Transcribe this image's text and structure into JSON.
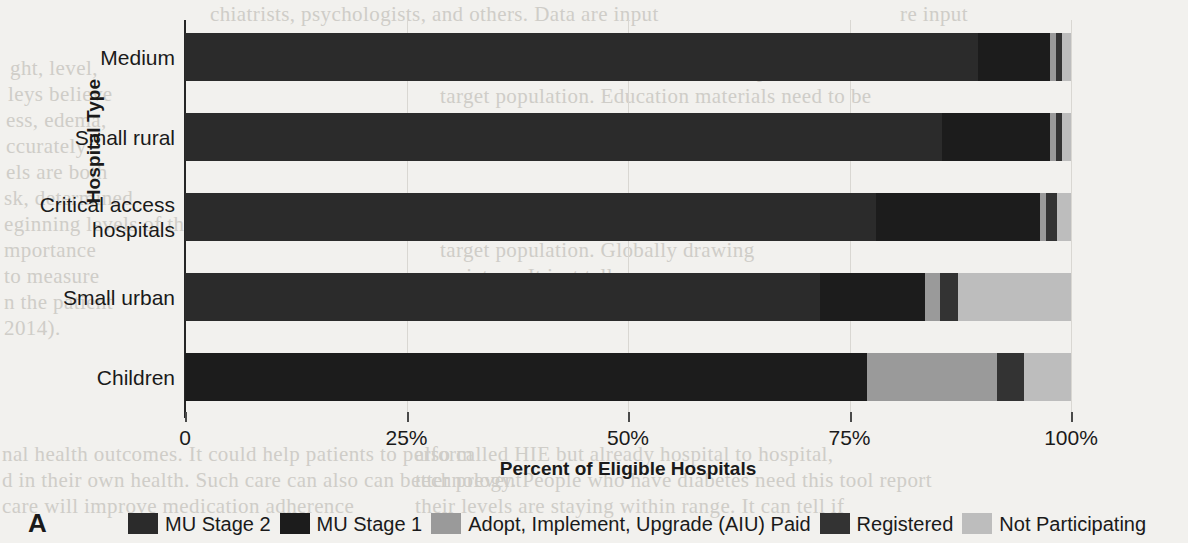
{
  "panel": {
    "letter": "A"
  },
  "axes": {
    "y_title": "Hospital Type",
    "x_title": "Percent of Eligible Hospitals",
    "x_ticks": [
      "0",
      "25%",
      "50%",
      "75%",
      "100%"
    ]
  },
  "legend": {
    "items": [
      {
        "label": "MU Stage 2",
        "color": "#2b2b2b"
      },
      {
        "label": "MU Stage 1",
        "color": "#1c1c1c"
      },
      {
        "label": "Adopt, Implement, Upgrade (AIU) Paid",
        "color": "#9a9a9a"
      },
      {
        "label": "Registered",
        "color": "#333333"
      },
      {
        "label": "Not Participating",
        "color": "#bdbdbd"
      }
    ]
  },
  "chart_data": {
    "type": "bar",
    "orientation": "horizontal",
    "stacked": true,
    "stack_total": 100,
    "title": "",
    "xlabel": "Percent of Eligible Hospitals",
    "ylabel": "Hospital Type",
    "xlim": [
      0,
      100
    ],
    "xticks": [
      0,
      25,
      50,
      75,
      100
    ],
    "xticklabels": [
      "0",
      "25%",
      "50%",
      "75%",
      "100%"
    ],
    "grid": true,
    "legend_position": "bottom",
    "categories": [
      "Medium",
      "Small rural",
      "Critical access\nhospitals",
      "Small urban",
      "Children"
    ],
    "series": [
      {
        "name": "MU Stage 2",
        "color": "#2b2b2b",
        "values": [
          89.5,
          85.4,
          78.0,
          71.7,
          0.0
        ]
      },
      {
        "name": "MU Stage 1",
        "color": "#1c1c1c",
        "values": [
          8.1,
          12.2,
          18.5,
          11.8,
          77.0
        ]
      },
      {
        "name": "Adopt, Implement, Upgrade (AIU) Paid",
        "color": "#9a9a9a",
        "values": [
          0.7,
          0.7,
          0.7,
          1.7,
          14.7
        ]
      },
      {
        "name": "Registered",
        "color": "#333333",
        "values": [
          0.7,
          0.7,
          1.2,
          2.0,
          3.0
        ]
      },
      {
        "name": "Not Participating",
        "color": "#bdbdbd",
        "values": [
          1.0,
          1.0,
          1.6,
          12.8,
          5.3
        ]
      }
    ]
  },
  "background_text": {
    "lines": [
      {
        "text": "chiatrists, psychologists, and others. Data are input",
        "x": 210,
        "y": 2
      },
      {
        "text": "e disease, chronic obstructive pulmonary disease.",
        "x": 200,
        "y": 30
      },
      {
        "text": "ght, level,",
        "x": 10,
        "y": 56
      },
      {
        "text": "leys believe",
        "x": 8,
        "y": 82
      },
      {
        "text": "ess, edema,",
        "x": 6,
        "y": 108
      },
      {
        "text": "ccurately",
        "x": 6,
        "y": 134
      },
      {
        "text": "els are both",
        "x": 6,
        "y": 160
      },
      {
        "text": "sk, determined",
        "x": 4,
        "y": 186
      },
      {
        "text": "eginning levels of their vitals will be able to comprehend",
        "x": 4,
        "y": 212
      },
      {
        "text": "mportance",
        "x": 4,
        "y": 238
      },
      {
        "text": "to measure",
        "x": 4,
        "y": 264
      },
      {
        "text": "n the patient",
        "x": 4,
        "y": 290
      },
      {
        "text": "2014).",
        "x": 4,
        "y": 316
      },
      {
        "text": "nal health outcomes. It could help patients to perform",
        "x": 2,
        "y": 442
      },
      {
        "text": "d in their own health. Such care can also can better prevent",
        "x": 2,
        "y": 468
      },
      {
        "text": "care will improve medication adherence",
        "x": 2,
        "y": 494
      },
      {
        "text": "Construct the informatics tool to be specific to the",
        "x": 430,
        "y": 58
      },
      {
        "text": "target population. Education materials need to be",
        "x": 440,
        "y": 84
      },
      {
        "text": "in more than five languages. How many",
        "x": 430,
        "y": 110
      },
      {
        "text": "Population Focus we are defining our patients in our",
        "x": 430,
        "y": 212
      },
      {
        "text": "target population. Globally drawing",
        "x": 440,
        "y": 238
      },
      {
        "text": "a picture. It just tells you",
        "x": 440,
        "y": 264
      },
      {
        "text": "also called HIE but already hospital to hospital,",
        "x": 415,
        "y": 442
      },
      {
        "text": "technology. People who have diabetes need this tool report",
        "x": 415,
        "y": 468
      },
      {
        "text": "their levels are staying within range. It can tell if",
        "x": 415,
        "y": 494
      },
      {
        "text": "re input",
        "x": 900,
        "y": 2
      },
      {
        "text": "ccess item the",
        "x": 880,
        "y": 30
      }
    ]
  }
}
